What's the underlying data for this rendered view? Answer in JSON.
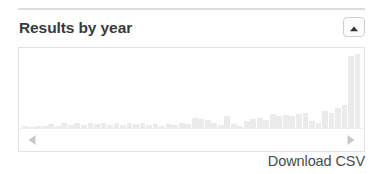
{
  "panel": {
    "title": "Results by year",
    "collapse_button": {
      "icon": "chevron-up-icon",
      "aria_label": "Collapse"
    }
  },
  "pager": {
    "prev": {
      "icon": "triangle-left-icon",
      "label": "Previous"
    },
    "next": {
      "icon": "triangle-right-icon",
      "label": "Next"
    }
  },
  "footer": {
    "download_label": "Download CSV"
  },
  "colors": {
    "bar": "#ebebeb",
    "panel_border": "#e3e3e3",
    "rule": "#dcdcdc",
    "title_text": "#3a3a3a",
    "link_text": "#4a4a4a",
    "arrow_fill": "#c9c9c9",
    "chevron_fill": "#333333"
  },
  "chart_data": {
    "type": "bar",
    "title": "Results by year",
    "xlabel": "",
    "ylabel": "",
    "grid": false,
    "legend": null,
    "ylim": [
      0,
      100
    ],
    "categories": [
      "1970",
      "1971",
      "1972",
      "1973",
      "1974",
      "1975",
      "1976",
      "1977",
      "1978",
      "1979",
      "1980",
      "1981",
      "1982",
      "1983",
      "1984",
      "1985",
      "1986",
      "1987",
      "1988",
      "1989",
      "1990",
      "1991",
      "1992",
      "1993",
      "1994",
      "1995",
      "1996",
      "1997",
      "1998",
      "1999",
      "2000",
      "2001",
      "2002",
      "2003",
      "2004",
      "2005",
      "2006",
      "2007",
      "2008",
      "2009",
      "2010",
      "2011",
      "2012",
      "2013",
      "2014",
      "2015",
      "2016",
      "2017",
      "2018",
      "2019",
      "2020",
      "2021"
    ],
    "values": [
      2,
      1,
      3,
      2,
      5,
      3,
      6,
      4,
      6,
      4,
      7,
      5,
      7,
      4,
      6,
      4,
      7,
      5,
      6,
      4,
      5,
      3,
      5,
      4,
      6,
      5,
      13,
      12,
      10,
      6,
      4,
      16,
      5,
      3,
      9,
      12,
      13,
      11,
      18,
      16,
      17,
      16,
      18,
      20,
      9,
      7,
      22,
      20,
      26,
      30,
      93,
      96
    ]
  }
}
